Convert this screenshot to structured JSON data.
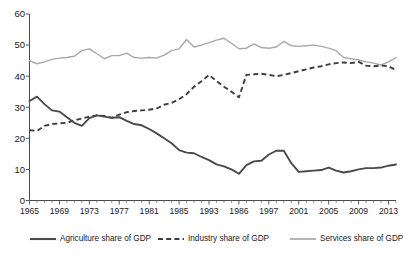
{
  "chart_data": {
    "type": "line",
    "title": "",
    "xlabel": "",
    "ylabel": "",
    "ylim": [
      0,
      60
    ],
    "yticks": [
      0,
      10,
      20,
      30,
      40,
      50,
      60
    ],
    "grid": false,
    "legend_position": "bottom",
    "x_tick_labels": [
      "1965",
      "1969",
      "1973",
      "1977",
      "1981",
      "1985",
      "1993",
      "1986",
      "1997",
      "2001",
      "2005",
      "2009",
      "2013"
    ],
    "x_tick_indices": [
      0,
      4,
      8,
      12,
      16,
      20,
      24,
      28,
      32,
      36,
      40,
      44,
      48
    ],
    "x": [
      1965,
      1966,
      1967,
      1968,
      1969,
      1970,
      1971,
      1972,
      1973,
      1974,
      1975,
      1976,
      1977,
      1978,
      1979,
      1980,
      1981,
      1982,
      1983,
      1984,
      1985,
      1986,
      1987,
      1988,
      1989,
      1990,
      1991,
      1992,
      1993,
      1994,
      1995,
      1996,
      1997,
      1998,
      1999,
      2000,
      2001,
      2002,
      2003,
      2004,
      2005,
      2006,
      2007,
      2008,
      2009,
      2010,
      2011,
      2012,
      2013,
      2014
    ],
    "series": [
      {
        "name": "Agriculture share of GDP",
        "color": "#4a4a4a",
        "style": "solid",
        "values": [
          32.0,
          33.4,
          31.0,
          29.0,
          28.6,
          26.8,
          25.0,
          24.0,
          26.5,
          27.4,
          27.0,
          26.6,
          26.8,
          25.6,
          24.6,
          24.2,
          23.0,
          21.6,
          20.0,
          18.4,
          16.2,
          15.4,
          15.2,
          14.0,
          13.0,
          11.6,
          11.0,
          10.0,
          8.6,
          11.4,
          12.6,
          12.8,
          14.8,
          16.0,
          16.0,
          12.0,
          9.2,
          9.4,
          9.6,
          9.8,
          10.6,
          9.6,
          9.0,
          9.4,
          10.0,
          10.4,
          10.4,
          10.6,
          11.2,
          11.6
        ]
      },
      {
        "name": "Industry share of GDP",
        "color": "#3d3d3d",
        "style": "dashed",
        "values": [
          22.6,
          22.4,
          24.0,
          24.6,
          24.8,
          25.0,
          25.8,
          26.4,
          27.0,
          27.4,
          27.2,
          26.6,
          27.6,
          28.4,
          28.8,
          29.0,
          29.2,
          29.6,
          30.8,
          31.4,
          32.6,
          34.2,
          36.6,
          38.4,
          40.4,
          38.4,
          36.6,
          35.0,
          33.2,
          40.4,
          40.6,
          40.8,
          40.4,
          40.0,
          40.4,
          41.0,
          41.6,
          42.2,
          42.8,
          43.2,
          43.8,
          44.2,
          44.4,
          44.2,
          44.6,
          43.4,
          43.2,
          43.4,
          43.2,
          42.0
        ]
      },
      {
        "name": "Services share of GDP",
        "color": "#a8a8a8",
        "style": "solid",
        "values": [
          45.0,
          44.0,
          44.6,
          45.4,
          45.8,
          46.0,
          46.4,
          48.2,
          48.8,
          47.2,
          45.6,
          46.6,
          46.6,
          47.4,
          46.0,
          45.8,
          46.0,
          45.8,
          46.8,
          48.2,
          48.8,
          51.8,
          49.4,
          50.0,
          50.8,
          51.6,
          52.2,
          50.6,
          48.8,
          49.0,
          50.4,
          49.2,
          49.0,
          49.4,
          51.2,
          49.8,
          49.6,
          49.8,
          50.0,
          49.6,
          49.0,
          48.2,
          46.0,
          45.6,
          45.2,
          44.6,
          44.2,
          43.6,
          44.6,
          46.0
        ]
      }
    ]
  },
  "legend": {
    "items": [
      {
        "label": "Agriculture share of GDP",
        "style": "solid-dark"
      },
      {
        "label": "Industry share of GDP",
        "style": "dashed"
      },
      {
        "label": "Services share of GDP",
        "style": "solid-light"
      }
    ]
  },
  "axes": {
    "y_tick_labels": [
      "60",
      "50",
      "40",
      "30",
      "20",
      "10",
      "0"
    ]
  }
}
